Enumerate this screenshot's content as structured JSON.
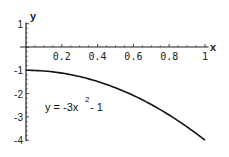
{
  "chart_data": {
    "type": "line",
    "title": "",
    "xlabel": "x",
    "ylabel": "y",
    "xlim": [
      0,
      1
    ],
    "ylim": [
      -4,
      1
    ],
    "grid": false,
    "legend": null,
    "x_ticks": [
      0.2,
      0.4,
      0.6,
      0.8,
      1
    ],
    "x_tick_labels": [
      "0.2",
      "0.4",
      "0.6",
      "0.8",
      "1"
    ],
    "y_ticks": [
      1,
      -1,
      -2,
      -3,
      -4
    ],
    "y_tick_labels": [
      "1",
      "-1",
      "-2",
      "-3",
      "-4"
    ],
    "annotation": {
      "text_base": "y = -3x",
      "text_exp": "2",
      "text_tail": " - 1",
      "full": "y = -3x^2 - 1"
    },
    "series": [
      {
        "name": "y = -3x^2 - 1",
        "x": [
          0,
          0.1,
          0.2,
          0.3,
          0.4,
          0.5,
          0.6,
          0.7,
          0.8,
          0.9,
          1.0
        ],
        "values": [
          -1,
          -1.03,
          -1.12,
          -1.27,
          -1.48,
          -1.75,
          -2.08,
          -2.47,
          -2.92,
          -3.43,
          -4
        ]
      }
    ],
    "colors": {
      "line": "#111111",
      "axes": "#222222",
      "background": "#ffffff"
    }
  }
}
